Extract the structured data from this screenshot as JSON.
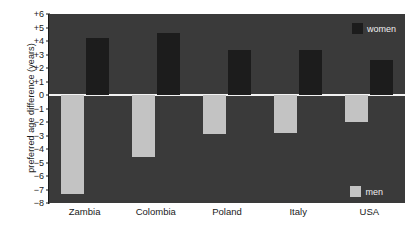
{
  "chart_data": {
    "type": "bar",
    "title": "",
    "xlabel": "",
    "ylabel": "preferred age difference (years)",
    "categories": [
      "Zambia",
      "Colombia",
      "Poland",
      "Italy",
      "USA"
    ],
    "series": [
      {
        "name": "men",
        "values": [
          -7.3,
          -4.6,
          -2.9,
          -2.8,
          -2.0
        ],
        "color": "#c3c3c3"
      },
      {
        "name": "women",
        "values": [
          4.2,
          4.6,
          3.3,
          3.3,
          2.6
        ],
        "color": "#1c1c1c"
      }
    ],
    "ylim": [
      -8,
      6
    ],
    "yticks": [
      6,
      5,
      4,
      3,
      2,
      1,
      0,
      -1,
      -2,
      -3,
      -4,
      -5,
      -6,
      -7,
      -8
    ],
    "ytick_labels": [
      "+6",
      "+5",
      "+4",
      "+3",
      "+2",
      "+1",
      "0",
      "−1",
      "−2",
      "−3",
      "−4",
      "−5",
      "−6",
      "−7",
      "−8"
    ],
    "grid": false,
    "legend_position": "inside-right",
    "zero_line": true,
    "plot_background": "#3a3a3a",
    "zero_line_color": "#f2f2f2"
  },
  "legend": {
    "women": {
      "label": "women",
      "color": "#1c1c1c"
    },
    "men": {
      "label": "men",
      "color": "#c3c3c3"
    }
  }
}
